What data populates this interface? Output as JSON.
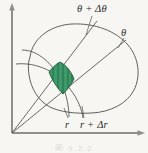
{
  "figure": {
    "kind": "polar-coordinate-area-element-diagram",
    "background_color": "#f7f6f3",
    "caption": "图 9.2.2",
    "labels": {
      "theta_plus_dtheta": {
        "base": "θ",
        "operator": "+",
        "delta": "Δ",
        "delta_var": "θ",
        "text": "θ + Δθ"
      },
      "theta": {
        "text": "θ"
      },
      "r": {
        "text": "r"
      },
      "r_plus_dr": {
        "base": "r",
        "operator": "+",
        "delta": "Δ",
        "delta_var": "r",
        "text": "r + Δr"
      }
    },
    "axes": {
      "color": "#8c8c8c",
      "origin": {
        "x": 12,
        "y": 133
      },
      "vertical_arrow_tip": {
        "x": 12,
        "y": 5
      },
      "horizontal_arrow_tip": {
        "x": 143,
        "y": 133
      }
    },
    "curves": {
      "color": "#4a4a4a",
      "blob_label": "region-boundary",
      "radial_lines": 2,
      "arcs": 2
    },
    "shaded_cell": {
      "label": "area-element",
      "fill_color": "#3f9a69",
      "edge_color": "#1f5f3d",
      "hatch_color": "#1c5c3b",
      "hatch_lines": 5,
      "hatch_orientation": "vertical"
    }
  }
}
